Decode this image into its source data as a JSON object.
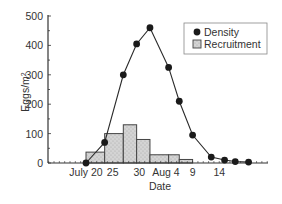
{
  "chart_data": {
    "type": "bar+line",
    "title": "",
    "xlabel": "Date",
    "ylabel": "Eggs/m²",
    "ylabel_base": "Eggs/m",
    "ylabel_sup": "2",
    "ylim": [
      0,
      500
    ],
    "yticks": [
      0,
      100,
      200,
      300,
      400,
      500
    ],
    "yminor_step": 50,
    "x_tick_labels": [
      {
        "label": "July 20",
        "day": 0
      },
      {
        "label": "25",
        "day": 5
      },
      {
        "label": "30",
        "day": 10
      },
      {
        "label": "Aug 4",
        "day": 15
      },
      {
        "label": "9",
        "day": 20
      },
      {
        "label": "14",
        "day": 25
      }
    ],
    "grid": false,
    "legend": {
      "position": "upper right",
      "entries": [
        {
          "label": "Density",
          "marker": "filled-circle"
        },
        {
          "label": "Recruitment",
          "marker": "stippled-square"
        }
      ]
    },
    "series": [
      {
        "name": "Density",
        "kind": "line",
        "points": [
          {
            "day": 0,
            "value": 0
          },
          {
            "day": 3.5,
            "value": 70
          },
          {
            "day": 7,
            "value": 300
          },
          {
            "day": 9.5,
            "value": 405
          },
          {
            "day": 12,
            "value": 460
          },
          {
            "day": 15.5,
            "value": 325
          },
          {
            "day": 17.5,
            "value": 210
          },
          {
            "day": 20,
            "value": 95
          },
          {
            "day": 23.5,
            "value": 20
          },
          {
            "day": 26,
            "value": 10
          },
          {
            "day": 28,
            "value": 5
          },
          {
            "day": 30.5,
            "value": 3
          }
        ]
      },
      {
        "name": "Recruitment",
        "kind": "histogram",
        "bins": [
          {
            "start": 0,
            "end": 3.5,
            "value": 37
          },
          {
            "start": 3.5,
            "end": 7,
            "value": 100
          },
          {
            "start": 7,
            "end": 9.5,
            "value": 130
          },
          {
            "start": 9.5,
            "end": 12,
            "value": 80
          },
          {
            "start": 12,
            "end": 15.5,
            "value": 28
          },
          {
            "start": 15.5,
            "end": 17.5,
            "value": 28
          },
          {
            "start": 17.5,
            "end": 20,
            "value": 12
          }
        ]
      }
    ]
  },
  "colors": {
    "axis": "#333333",
    "line": "#2a2a2a",
    "marker": "#1a1a1a",
    "bar_fill": "#d4d4d4",
    "bar_stipple": "#a8a8a8",
    "bar_edge": "#444444",
    "legend_border": "#888888"
  }
}
